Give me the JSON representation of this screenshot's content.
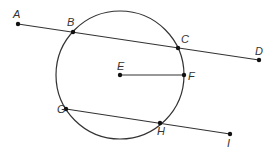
{
  "diagram": {
    "type": "circle-geometry",
    "stroke_color": "#333333",
    "circle": {
      "center": "E",
      "cx": 120,
      "cy": 75,
      "r": 64
    },
    "points": [
      {
        "label": "A",
        "x": 18,
        "y": 24,
        "lx": 13,
        "ly": 18
      },
      {
        "label": "B",
        "x": 73,
        "y": 32,
        "lx": 67,
        "ly": 26
      },
      {
        "label": "C",
        "x": 178,
        "y": 48,
        "lx": 181,
        "ly": 43
      },
      {
        "label": "D",
        "x": 259,
        "y": 60,
        "lx": 255,
        "ly": 55
      },
      {
        "label": "E",
        "x": 120,
        "y": 75,
        "lx": 117,
        "ly": 70
      },
      {
        "label": "F",
        "x": 184,
        "y": 75,
        "lx": 188,
        "ly": 80
      },
      {
        "label": "G",
        "x": 66,
        "y": 109,
        "lx": 57,
        "ly": 113
      },
      {
        "label": "H",
        "x": 160,
        "y": 123,
        "lx": 157,
        "ly": 135
      },
      {
        "label": "I",
        "x": 230,
        "y": 134,
        "lx": 227,
        "ly": 147
      }
    ],
    "segments": [
      {
        "name": "line-AD",
        "from": "A",
        "to": "D",
        "x1": 18,
        "y1": 24,
        "x2": 259,
        "y2": 60
      },
      {
        "name": "radius-EF",
        "from": "E",
        "to": "F",
        "x1": 120,
        "y1": 75,
        "x2": 184,
        "y2": 75
      },
      {
        "name": "line-GI",
        "from": "G",
        "to": "I",
        "x1": 66,
        "y1": 109,
        "x2": 230,
        "y2": 134
      }
    ]
  }
}
